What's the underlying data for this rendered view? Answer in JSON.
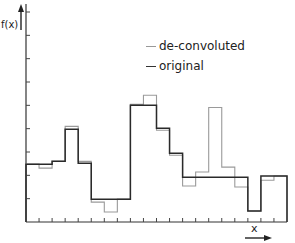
{
  "chart_data": {
    "type": "histogram-step",
    "title": "",
    "xlabel": "x",
    "ylabel": "f(x)",
    "x_tick_count": 20,
    "y_tick_count": 9,
    "ylim": [
      0,
      9
    ],
    "grid": false,
    "legend_position": "upper right (inside)",
    "legend": [
      "de-convoluted",
      "original"
    ],
    "bins": [
      1,
      2,
      3,
      4,
      5,
      6,
      7,
      8,
      9,
      10,
      11,
      12,
      13,
      14,
      15,
      16,
      17,
      18,
      19,
      20
    ],
    "series": [
      {
        "name": "de-convoluted",
        "color": "#9a9a9a",
        "values": [
          2.48,
          2.31,
          2.6,
          4.1,
          2.6,
          0.85,
          0.43,
          0.98,
          5.04,
          5.43,
          3.93,
          2.86,
          1.54,
          2.14,
          4.91,
          2.35,
          1.5,
          0.47,
          1.79,
          1.97
        ]
      },
      {
        "name": "original",
        "color": "#2a2a2a",
        "values": [
          2.48,
          2.48,
          2.6,
          3.97,
          2.52,
          0.98,
          0.98,
          0.98,
          5.0,
          5.0,
          4.02,
          2.95,
          1.92,
          1.92,
          1.92,
          1.92,
          1.92,
          0.47,
          1.97,
          1.97
        ]
      }
    ]
  },
  "labels": {
    "ylabel": "f(x)",
    "xlabel": "x",
    "legend_deconv": "de-convoluted",
    "legend_orig": "original"
  }
}
